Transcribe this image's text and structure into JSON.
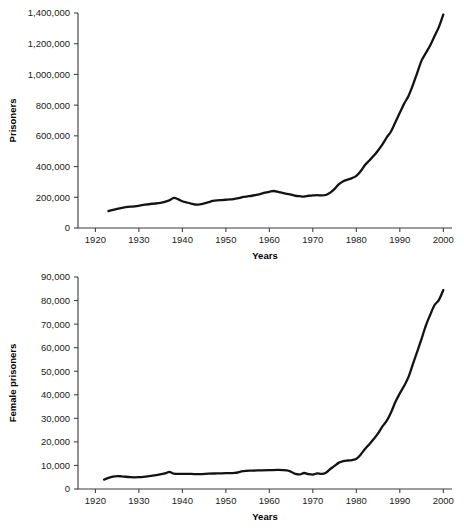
{
  "figure": {
    "background_color": "#ffffff",
    "line_color": "#131313",
    "axis_color": "#3a3a3a"
  },
  "chart_data": [
    {
      "id": "total-prisoners",
      "type": "line",
      "title": "",
      "xlabel": "Years",
      "ylabel": "Prisoners",
      "xlim": [
        1916,
        2002
      ],
      "ylim": [
        0,
        1400000
      ],
      "grid": false,
      "legend": false,
      "xticks": [
        1920,
        1930,
        1940,
        1950,
        1960,
        1970,
        1980,
        1990,
        2000
      ],
      "xtick_labels": [
        "1920",
        "1930",
        "1940",
        "1950",
        "1960",
        "1970",
        "1980",
        "1990",
        "2000"
      ],
      "yticks": [
        0,
        200000,
        400000,
        600000,
        800000,
        1000000,
        1200000,
        1400000
      ],
      "ytick_labels": [
        "0",
        "200,000",
        "400,000",
        "600,000",
        "800,000",
        "1,000,000",
        "1,200,000",
        "1,400,000"
      ],
      "series": [
        {
          "name": "Prisoners",
          "x": [
            1923,
            1925,
            1927,
            1929,
            1931,
            1933,
            1935,
            1937,
            1938,
            1939,
            1940,
            1941,
            1942,
            1943,
            1944,
            1945,
            1946,
            1947,
            1948,
            1949,
            1950,
            1951,
            1952,
            1953,
            1954,
            1955,
            1956,
            1957,
            1958,
            1959,
            1960,
            1961,
            1962,
            1963,
            1964,
            1965,
            1966,
            1967,
            1968,
            1969,
            1970,
            1971,
            1972,
            1973,
            1974,
            1975,
            1976,
            1977,
            1978,
            1979,
            1980,
            1981,
            1982,
            1983,
            1984,
            1985,
            1986,
            1987,
            1988,
            1989,
            1990,
            1991,
            1992,
            1993,
            1994,
            1995,
            1996,
            1997,
            1998,
            1999,
            2000
          ],
          "values": [
            110000,
            125000,
            136000,
            141000,
            150000,
            158000,
            163000,
            180000,
            196000,
            188000,
            174000,
            166000,
            159000,
            153000,
            154000,
            160000,
            168000,
            176000,
            180000,
            182000,
            184000,
            186000,
            190000,
            195000,
            202000,
            206000,
            210000,
            215000,
            222000,
            230000,
            236000,
            241000,
            236000,
            228000,
            222000,
            218000,
            210000,
            207000,
            205000,
            210000,
            212000,
            214000,
            212000,
            215000,
            230000,
            255000,
            285000,
            305000,
            315000,
            325000,
            340000,
            370000,
            410000,
            440000,
            470000,
            505000,
            545000,
            590000,
            630000,
            690000,
            750000,
            810000,
            860000,
            930000,
            1010000,
            1090000,
            1140000,
            1190000,
            1250000,
            1310000,
            1390000
          ]
        }
      ]
    },
    {
      "id": "female-prisoners",
      "type": "line",
      "title": "",
      "xlabel": "Years",
      "ylabel": "Female prisoners",
      "xlim": [
        1916,
        2002
      ],
      "ylim": [
        0,
        90000
      ],
      "grid": false,
      "legend": false,
      "xticks": [
        1920,
        1930,
        1940,
        1950,
        1960,
        1970,
        1980,
        1990,
        2000
      ],
      "xtick_labels": [
        "1920",
        "1930",
        "1940",
        "1950",
        "1960",
        "1970",
        "1980",
        "1990",
        "2000"
      ],
      "yticks": [
        0,
        10000,
        20000,
        30000,
        40000,
        50000,
        60000,
        70000,
        80000,
        90000
      ],
      "ytick_labels": [
        "0",
        "10,000",
        "20,000",
        "30,000",
        "40,000",
        "50,000",
        "60,000",
        "70,000",
        "80,000",
        "90,000"
      ],
      "series": [
        {
          "name": "Female prisoners",
          "x": [
            1922,
            1924,
            1926,
            1928,
            1930,
            1932,
            1934,
            1936,
            1937,
            1938,
            1940,
            1942,
            1944,
            1946,
            1948,
            1950,
            1952,
            1954,
            1956,
            1958,
            1960,
            1962,
            1964,
            1965,
            1966,
            1967,
            1968,
            1969,
            1970,
            1971,
            1972,
            1973,
            1974,
            1975,
            1976,
            1977,
            1978,
            1979,
            1980,
            1981,
            1982,
            1983,
            1984,
            1985,
            1986,
            1987,
            1988,
            1989,
            1990,
            1991,
            1992,
            1993,
            1994,
            1995,
            1996,
            1997,
            1998,
            1999,
            2000
          ],
          "values": [
            4000,
            5300,
            5400,
            5000,
            5000,
            5400,
            5900,
            6600,
            7300,
            6500,
            6400,
            6400,
            6300,
            6500,
            6600,
            6700,
            6800,
            7600,
            7800,
            7900,
            8000,
            8100,
            7900,
            7300,
            6400,
            6200,
            6800,
            6300,
            6100,
            6600,
            6400,
            6900,
            8500,
            9800,
            11200,
            11800,
            12100,
            12300,
            12800,
            14600,
            17000,
            19000,
            21200,
            23600,
            26600,
            29000,
            32600,
            37000,
            40600,
            43800,
            47600,
            53000,
            58300,
            63700,
            69500,
            74000,
            78100,
            80300,
            84500
          ]
        }
      ]
    }
  ]
}
